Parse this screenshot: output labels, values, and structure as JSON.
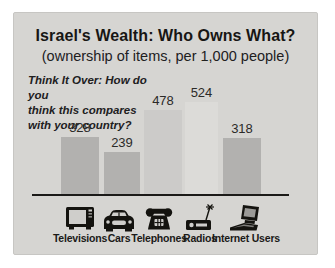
{
  "chart_data": {
    "type": "bar",
    "title": "Israel's Wealth: Who Owns What?",
    "subtitle": "(ownership of items, per 1,000 people)",
    "annotation": "Think It Over: How do you\nthink this compares\nwith your country?",
    "categories": [
      "Televisions",
      "Cars",
      "Telephones",
      "Radios",
      "Internet Users"
    ],
    "values": [
      328,
      239,
      478,
      524,
      318
    ],
    "icons": [
      "television-icon",
      "car-icon",
      "telephone-icon",
      "radio-icon",
      "computer-icon"
    ],
    "bar_colors": [
      "#b2b1af",
      "#b2b1af",
      "#cccbc9",
      "#dcdbd8",
      "#b2b1af"
    ],
    "background_color": "#d6d5d2",
    "axis_color": "#1b1a18",
    "value_label_color": "#2b2a28",
    "xlabel": "",
    "ylabel": "",
    "ylim": [
      0,
      560
    ],
    "grid": false,
    "legend": false
  }
}
